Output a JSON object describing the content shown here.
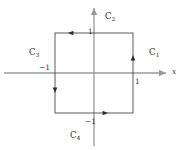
{
  "figure": {
    "background_color": "#ffffff",
    "axis_color": "#9a9a9a",
    "contour_color": "#4a4a4a",
    "text_color": "#2b2b2b"
  },
  "axes": {
    "x_axis_label": "x",
    "x_axis_name": "horizontal-axis",
    "y_axis_name": "vertical-axis",
    "origin": {
      "x": 94,
      "y": 73
    }
  },
  "ticks": [
    {
      "name": "tick-label-y-positive-one",
      "text": "1",
      "x": 88,
      "y": 28
    },
    {
      "name": "tick-label-x-negative-one",
      "text": "−1",
      "x": 39,
      "y": 64
    },
    {
      "name": "tick-label-x-positive-one",
      "text": "1",
      "x": 135,
      "y": 78
    },
    {
      "name": "tick-label-y-negative-one",
      "text": "−1",
      "x": 85,
      "y": 118
    }
  ],
  "contour": {
    "description": "counterclockwise square contour",
    "corners": [
      {
        "x": -1,
        "y": -1
      },
      {
        "x": 1,
        "y": -1
      },
      {
        "x": 1,
        "y": 1
      },
      {
        "x": -1,
        "y": 1
      }
    ],
    "segments": [
      {
        "label": "C",
        "subscript": "1",
        "name": "curve-label-c1",
        "side": "right",
        "direction": "up",
        "x": 149,
        "y": 48
      },
      {
        "label": "C",
        "subscript": "2",
        "name": "curve-label-c2",
        "side": "top",
        "direction": "left",
        "x": 105,
        "y": 12
      },
      {
        "label": "C",
        "subscript": "3",
        "name": "curve-label-c3",
        "side": "left",
        "direction": "down",
        "x": 29,
        "y": 48
      },
      {
        "label": "C",
        "subscript": "4",
        "name": "curve-label-c4",
        "side": "bottom",
        "direction": "right",
        "x": 70,
        "y": 131
      }
    ]
  }
}
